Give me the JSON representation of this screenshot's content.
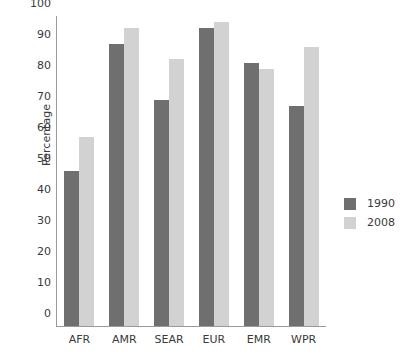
{
  "chart_data": {
    "type": "bar",
    "title": "",
    "xlabel": "",
    "ylabel": "Percentage",
    "ylim": [
      0,
      100
    ],
    "yticks": [
      0,
      10,
      20,
      30,
      40,
      50,
      60,
      70,
      80,
      90,
      100
    ],
    "ytick_labels": [
      "0",
      "10",
      "20",
      "30",
      "40",
      "50",
      "60",
      "70",
      "80",
      "90",
      "100"
    ],
    "grid": false,
    "legend_position": "right",
    "categories": [
      "AFR",
      "AMR",
      "SEAR",
      "EUR",
      "EMR",
      "WPR"
    ],
    "series": [
      {
        "name": "1990",
        "color": "#6f6f6f",
        "values": [
          50,
          91,
          73,
          96,
          85,
          71
        ]
      },
      {
        "name": "2008",
        "color": "#d2d2d2",
        "values": [
          61,
          96,
          86,
          98,
          83,
          90
        ]
      }
    ]
  }
}
